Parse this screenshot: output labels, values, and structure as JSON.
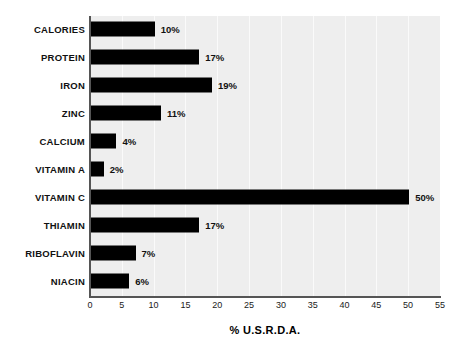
{
  "chart_data": {
    "type": "bar",
    "orientation": "horizontal",
    "title": "",
    "xlabel": "% U.S.R.D.A.",
    "ylabel": "",
    "xlim": [
      0,
      55
    ],
    "xticks": [
      "0",
      "5",
      "10",
      "15",
      "20",
      "25",
      "30",
      "35",
      "40",
      "45",
      "50",
      "55"
    ],
    "xtick_values": [
      0,
      5,
      10,
      15,
      20,
      25,
      30,
      35,
      40,
      45,
      50,
      55
    ],
    "grid": true,
    "legend": false,
    "categories": [
      "CALORIES",
      "PROTEIN",
      "IRON",
      "ZINC",
      "CALCIUM",
      "VITAMIN A",
      "VITAMIN C",
      "THIAMIN",
      "RIBOFLAVIN",
      "NIACIN"
    ],
    "values": [
      10,
      17,
      19,
      11,
      4,
      2,
      50,
      17,
      7,
      6
    ],
    "data_labels": [
      "10%",
      "17%",
      "19%",
      "11%",
      "4%",
      "2%",
      "50%",
      "17%",
      "7%",
      "6%"
    ],
    "colors": {
      "bar": "#000000",
      "plot_background": "#eeeeee",
      "figure_background": "#ffffff",
      "axis": "#555555",
      "gridline": "#fafafa",
      "text": "#111111"
    }
  }
}
